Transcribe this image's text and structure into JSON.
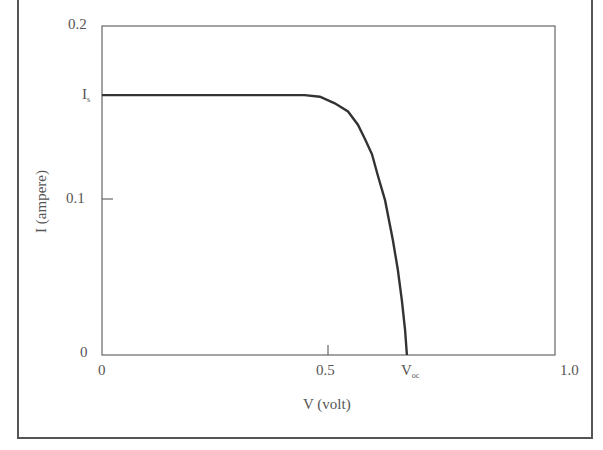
{
  "chart_data": {
    "type": "line",
    "title": "",
    "xlabel": "V (volt)",
    "ylabel": "I (ampere)",
    "xlim": [
      0,
      1.0
    ],
    "ylim": [
      0,
      0.2
    ],
    "grid": false,
    "legend": null,
    "x_ticks": [
      {
        "value": 0,
        "label": "0"
      },
      {
        "value": 0.5,
        "label": "0.5"
      },
      {
        "value": 0.673,
        "label": "V",
        "subscript": "oc"
      },
      {
        "value": 1.0,
        "label": "1.0"
      }
    ],
    "y_ticks": [
      {
        "value": 0,
        "label": "0"
      },
      {
        "value": 0.1,
        "label": "0.1"
      },
      {
        "value": 0.158,
        "label": "I",
        "subscript": "s"
      },
      {
        "value": 0.2,
        "label": "0.2"
      }
    ],
    "series": [
      {
        "name": "I-V characteristic",
        "x": [
          0,
          0.1,
          0.2,
          0.3,
          0.4,
          0.447,
          0.481,
          0.514,
          0.543,
          0.565,
          0.581,
          0.596,
          0.609,
          0.625,
          0.642,
          0.653,
          0.662,
          0.669,
          0.673
        ],
        "y": [
          0.158,
          0.158,
          0.158,
          0.158,
          0.158,
          0.158,
          0.157,
          0.153,
          0.148,
          0.14,
          0.131,
          0.122,
          0.109,
          0.094,
          0.07,
          0.052,
          0.033,
          0.015,
          0.0
        ]
      }
    ],
    "annotations": [
      {
        "text": "Is",
        "meaning": "saturation/short-circuit current level"
      },
      {
        "text": "Voc",
        "meaning": "open-circuit voltage"
      }
    ]
  },
  "labels": {
    "xlabel": "V (volt)",
    "ylabel": "I (ampere)",
    "x0": "0",
    "x05": "0.5",
    "xvoc_main": "V",
    "xvoc_sub": "oc",
    "x1": "1.0",
    "y0": "0",
    "y01": "0.1",
    "yis_main": "I",
    "yis_sub": "s",
    "y02": "0.2"
  },
  "colors": {
    "curve": "#333333",
    "axes": "#555555",
    "text": "#555555"
  }
}
